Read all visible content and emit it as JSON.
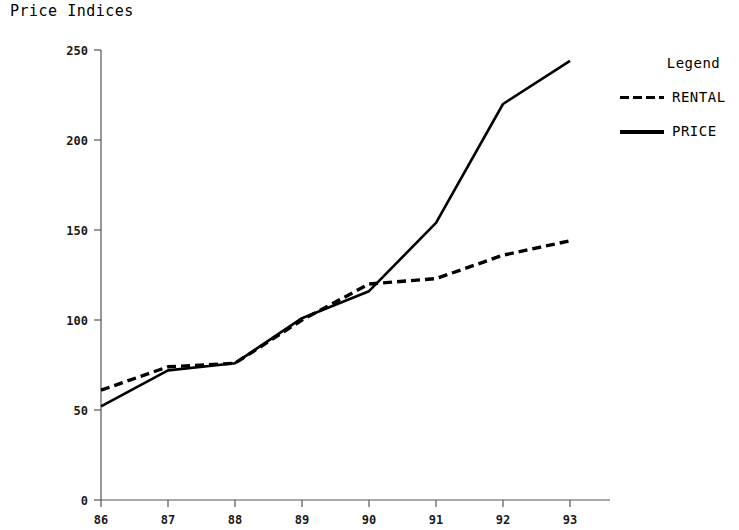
{
  "chart_data": {
    "type": "line",
    "title": "Price Indices",
    "xlabel": "",
    "ylabel": "",
    "x": [
      "86",
      "87",
      "88",
      "89",
      "90",
      "91",
      "92",
      "93"
    ],
    "categories": [
      "86",
      "87",
      "88",
      "89",
      "90",
      "91",
      "92",
      "93"
    ],
    "series": [
      {
        "name": "RENTAL",
        "style": "dashed",
        "color": "#000000",
        "values": [
          61,
          74,
          76,
          100,
          120,
          123,
          136,
          144
        ]
      },
      {
        "name": "PRICE",
        "style": "solid",
        "color": "#000000",
        "values": [
          52,
          72,
          76,
          101,
          116,
          154,
          220,
          244
        ]
      }
    ],
    "xlim": [
      0,
      7
    ],
    "ylim": [
      0,
      250
    ],
    "yticks": [
      0,
      50,
      100,
      150,
      200,
      250
    ],
    "ytick_labels": [
      "0",
      "50",
      "100",
      "150",
      "200",
      "250"
    ],
    "xtick_labels": [
      "86",
      "87",
      "88",
      "89",
      "90",
      "91",
      "92",
      "93"
    ],
    "grid": false,
    "legend": {
      "title": "Legend",
      "position": "right",
      "entries": [
        {
          "label": "RENTAL",
          "style": "dashed"
        },
        {
          "label": "PRICE",
          "style": "solid"
        }
      ]
    }
  }
}
